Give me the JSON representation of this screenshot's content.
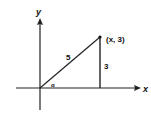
{
  "diagram": {
    "axes": {
      "x_label": "x",
      "y_label": "y"
    },
    "point_label": "(x, 3)",
    "hypotenuse_label": "5",
    "vertical_side_label": "3",
    "angle_label": "α"
  }
}
